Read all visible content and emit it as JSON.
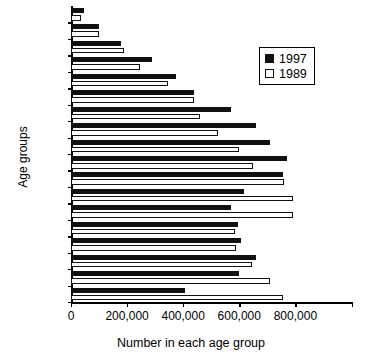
{
  "chart_data": {
    "type": "bar",
    "orientation": "horizontal",
    "title": "",
    "xlabel": "Number in each age group",
    "ylabel": "Age groups",
    "xlim": [
      0,
      1000000
    ],
    "xticks": [
      0,
      200000,
      400000,
      600000,
      800000,
      1000000
    ],
    "xticklabels": [
      "0",
      "200,000",
      "400,000",
      "600,000",
      "800,000",
      "1,000,000"
    ],
    "grid": false,
    "legend_position": "upper right",
    "categories": [
      "0-4",
      "5-9",
      "10-14",
      "15-19",
      "20-24",
      "25-29",
      "30-34",
      "35-39",
      "40-44",
      "45-49",
      "50-54",
      "55-59",
      "60-64",
      "65-69",
      "70-74",
      "75-79",
      "80-84",
      "85+"
    ],
    "ylabels_shown": [
      "0-4",
      "10-14",
      "20-24",
      "30-34",
      "40-44",
      "50-54",
      "60-64",
      "70-74",
      "80-84"
    ],
    "series": [
      {
        "name": "1997",
        "color": "#111111",
        "values": [
          405000,
          600000,
          660000,
          605000,
          595000,
          570000,
          615000,
          755000,
          770000,
          710000,
          660000,
          570000,
          440000,
          375000,
          290000,
          180000,
          100000,
          48000
        ]
      },
      {
        "name": "1989",
        "color": "#ffffff",
        "values": [
          755000,
          710000,
          645000,
          590000,
          585000,
          790000,
          790000,
          760000,
          650000,
          600000,
          525000,
          460000,
          440000,
          345000,
          245000,
          190000,
          100000,
          34000
        ]
      }
    ]
  },
  "legend": {
    "entries": [
      {
        "label": "1997",
        "icon": "filled-square-icon"
      },
      {
        "label": "1989",
        "icon": "open-square-icon"
      }
    ]
  },
  "axes": {
    "x_title": "Number in each age group",
    "y_title": "Age groups",
    "x_tick_labels": [
      "0",
      "200,000",
      "400,000",
      "600,000",
      "800,000",
      "1,000,0",
      "00"
    ],
    "y_tick_labels": [
      "80-84",
      "70-74",
      "60-64",
      "50-54",
      "40-44",
      "30-34",
      "20-24",
      "10-14",
      "0-4"
    ]
  }
}
